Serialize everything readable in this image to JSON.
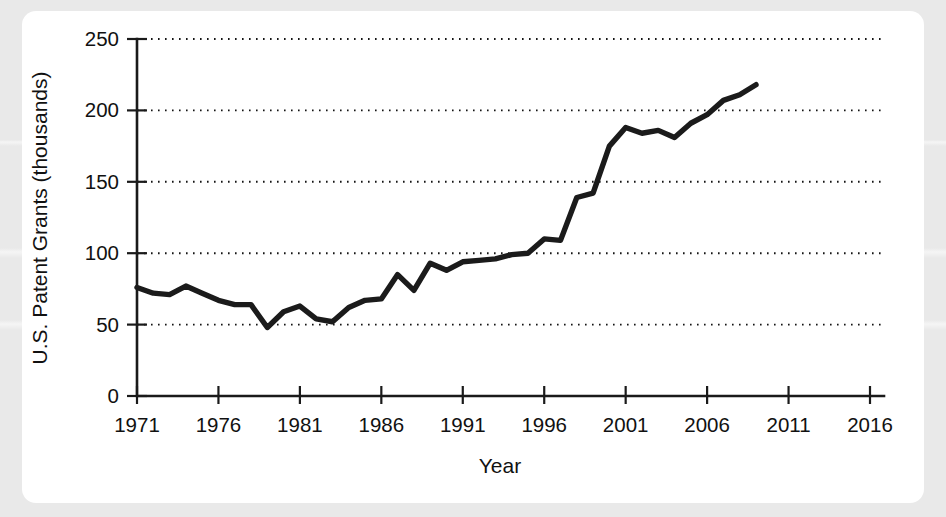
{
  "figure": {
    "background_color": "#e9e9e9",
    "card_color": "#ffffff",
    "line_color": "#1b1b1b"
  },
  "chart_data": {
    "type": "line",
    "title": "",
    "xlabel": "Year",
    "ylabel": "U.S. Patent Grants (thousands)",
    "xlim": [
      1971,
      2016
    ],
    "ylim": [
      0,
      250
    ],
    "xticks": [
      1971,
      1976,
      1981,
      1986,
      1991,
      1996,
      2001,
      2006,
      2011,
      2016
    ],
    "xtick_labels": [
      "1971",
      "1976",
      "1981",
      "1986",
      "1991",
      "1996",
      "2001",
      "2006",
      "2011",
      "2016"
    ],
    "yticks": [
      0,
      50,
      100,
      150,
      200,
      250
    ],
    "ytick_labels": [
      "0",
      "50",
      "100",
      "150",
      "200",
      "250"
    ],
    "grid": "horizontal-dotted",
    "legend": "none",
    "series": [
      {
        "name": "U.S. Patent Grants",
        "x": [
          1971,
          1972,
          1973,
          1974,
          1975,
          1976,
          1977,
          1978,
          1979,
          1980,
          1981,
          1982,
          1983,
          1984,
          1985,
          1986,
          1987,
          1988,
          1989,
          1990,
          1991,
          1992,
          1993,
          1994,
          1995,
          1996,
          1997,
          1998,
          1999,
          2000,
          2001,
          2002,
          2003,
          2004,
          2005,
          2006,
          2007,
          2008,
          2009
        ],
        "values": [
          76,
          72,
          71,
          77,
          72,
          67,
          64,
          64,
          48,
          59,
          63,
          54,
          52,
          62,
          67,
          68,
          85,
          74,
          93,
          88,
          94,
          95,
          96,
          99,
          100,
          110,
          109,
          139,
          142,
          175,
          188,
          184,
          186,
          181,
          191,
          197,
          207,
          211,
          218
        ]
      }
    ]
  }
}
